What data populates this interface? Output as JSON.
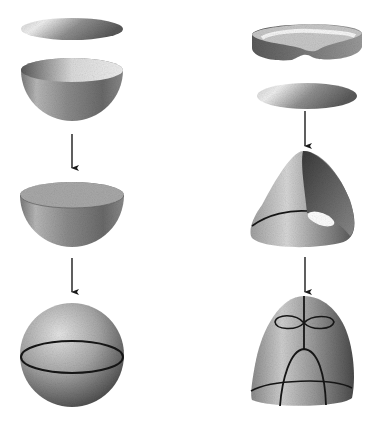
{
  "figure": {
    "left_column": {
      "name": "sphere-construction",
      "steps": [
        "disc",
        "hemisphere",
        "hemisphere-with-disc-glued",
        "sphere-with-equator"
      ]
    },
    "right_column": {
      "name": "projective-plane-construction",
      "steps": [
        "mobius-band",
        "disc",
        "cross-cap",
        "cross-cap-closed-surface"
      ]
    },
    "arrows": 4
  },
  "colors": {
    "background": "#ffffff",
    "shade_dark": "#3a3a3a",
    "shade_mid": "#8a8a8a",
    "shade_light": "#e2e2e2",
    "line": "#1a1a1a"
  }
}
